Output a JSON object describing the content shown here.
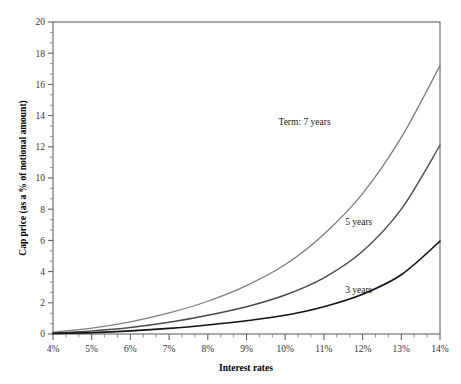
{
  "chart_data": {
    "type": "line",
    "title": "",
    "xlabel": "Interest rates",
    "ylabel": "Cap price (as a % of notional amount)",
    "xlim": [
      4,
      14
    ],
    "ylim": [
      0,
      20
    ],
    "xticks": [
      "4%",
      "5%",
      "6%",
      "7%",
      "8%",
      "9%",
      "10%",
      "11%",
      "12%",
      "13%",
      "14%"
    ],
    "xtick_values": [
      4,
      5,
      6,
      7,
      8,
      9,
      10,
      11,
      12,
      13,
      14
    ],
    "yticks": [
      "0",
      "2",
      "4",
      "6",
      "8",
      "10",
      "12",
      "14",
      "16",
      "18",
      "20"
    ],
    "ytick_values": [
      0,
      2,
      4,
      6,
      8,
      10,
      12,
      14,
      16,
      18,
      20
    ],
    "minor_ticks_per_interval": 2,
    "grid": false,
    "legend_position": "inline-annotations",
    "x": [
      4,
      5,
      6,
      7,
      8,
      9,
      10,
      11,
      12,
      13,
      14
    ],
    "series": [
      {
        "name": "Term: 7 years",
        "label": "Term: 7 years",
        "color": "#7d7d7d",
        "width": 1.3,
        "values": [
          0.12,
          0.38,
          0.78,
          1.35,
          2.1,
          3.1,
          4.45,
          6.4,
          9.0,
          12.6,
          17.2
        ],
        "label_x": 10.5,
        "label_y": 13.4
      },
      {
        "name": "5 years",
        "label": "5 years",
        "color": "#4a4a4a",
        "width": 1.4,
        "values": [
          0.06,
          0.2,
          0.42,
          0.75,
          1.2,
          1.75,
          2.5,
          3.6,
          5.3,
          8.0,
          12.1
        ],
        "label_x": 11.9,
        "label_y": 7.0
      },
      {
        "name": "3 years",
        "label": "3 years",
        "color": "#111111",
        "width": 1.6,
        "values": [
          0.03,
          0.09,
          0.2,
          0.36,
          0.58,
          0.85,
          1.2,
          1.75,
          2.55,
          3.8,
          5.95
        ],
        "label_x": 11.9,
        "label_y": 2.6
      }
    ]
  },
  "axes": {
    "x_axis_title": "Interest rates",
    "y_axis_title": "Cap price (as a % of notional amount)"
  }
}
